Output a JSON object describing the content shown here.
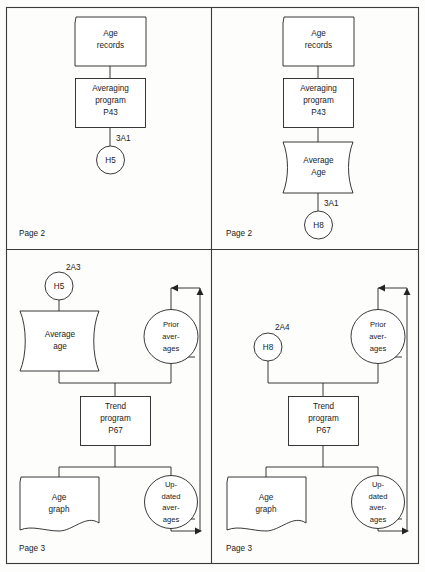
{
  "diagram": {
    "colors": {
      "stroke": "#232323",
      "frame": "#3a3a3a",
      "background": "#fdfdfc",
      "shape_fill": "#ffffff"
    },
    "panels": [
      {
        "id": "panel-top-left",
        "page_label": "Page 2",
        "nodes": [
          {
            "id": "tl-age-records",
            "shape": "punched-card",
            "lines": [
              "Age",
              "records"
            ]
          },
          {
            "id": "tl-averaging-program",
            "shape": "process",
            "lines": [
              "Averaging",
              "program",
              "P43"
            ]
          },
          {
            "id": "tl-h5",
            "shape": "connector-circle",
            "lines": [
              "H5"
            ]
          }
        ],
        "connector_refs": [
          {
            "id": "tl-ref-3a1",
            "text": "3A1"
          }
        ]
      },
      {
        "id": "panel-top-right",
        "page_label": "Page 2",
        "nodes": [
          {
            "id": "tr-age-records",
            "shape": "punched-card",
            "lines": [
              "Age",
              "records"
            ]
          },
          {
            "id": "tr-averaging-program",
            "shape": "process",
            "lines": [
              "Averaging",
              "program",
              "P43"
            ]
          },
          {
            "id": "tr-average-age",
            "shape": "magnetic-tape",
            "lines": [
              "Average",
              "Age"
            ]
          },
          {
            "id": "tr-h8",
            "shape": "connector-circle",
            "lines": [
              "H8"
            ]
          }
        ],
        "connector_refs": [
          {
            "id": "tr-ref-3a1",
            "text": "3A1"
          }
        ]
      },
      {
        "id": "panel-bottom-left",
        "page_label": "Page 3",
        "nodes": [
          {
            "id": "bl-h5",
            "shape": "connector-circle",
            "lines": [
              "H5"
            ]
          },
          {
            "id": "bl-average-age",
            "shape": "magnetic-tape",
            "lines": [
              "Average",
              "age"
            ]
          },
          {
            "id": "bl-prior-averages",
            "shape": "magnetic-drum",
            "lines": [
              "Prior",
              "aver-",
              "ages"
            ]
          },
          {
            "id": "bl-trend-program",
            "shape": "process",
            "lines": [
              "Trend",
              "program",
              "P67"
            ]
          },
          {
            "id": "bl-age-graph",
            "shape": "document",
            "lines": [
              "Age",
              "graph"
            ]
          },
          {
            "id": "bl-updated-averages",
            "shape": "magnetic-drum",
            "lines": [
              "Up-",
              "dated",
              "aver-",
              "ages"
            ]
          }
        ],
        "connector_refs": [
          {
            "id": "bl-ref-2a3",
            "text": "2A3"
          }
        ]
      },
      {
        "id": "panel-bottom-right",
        "page_label": "Page 3",
        "nodes": [
          {
            "id": "br-h8",
            "shape": "connector-circle",
            "lines": [
              "H8"
            ]
          },
          {
            "id": "br-prior-averages",
            "shape": "magnetic-drum",
            "lines": [
              "Prior",
              "aver-",
              "ages"
            ]
          },
          {
            "id": "br-trend-program",
            "shape": "process",
            "lines": [
              "Trend",
              "program",
              "P67"
            ]
          },
          {
            "id": "br-age-graph",
            "shape": "document",
            "lines": [
              "Age",
              "graph"
            ]
          },
          {
            "id": "br-updated-averages",
            "shape": "magnetic-drum",
            "lines": [
              "Up-",
              "dated",
              "aver-",
              "ages"
            ]
          }
        ],
        "connector_refs": [
          {
            "id": "br-ref-2a4",
            "text": "2A4"
          }
        ]
      }
    ],
    "text": {
      "tl": {
        "age_records_1": "Age",
        "age_records_2": "records",
        "avg_prog_1": "Averaging",
        "avg_prog_2": "program",
        "avg_prog_3": "P43",
        "h5": "H5",
        "ref_3a1": "3A1",
        "page": "Page 2"
      },
      "tr": {
        "age_records_1": "Age",
        "age_records_2": "records",
        "avg_prog_1": "Averaging",
        "avg_prog_2": "program",
        "avg_prog_3": "P43",
        "avg_age_1": "Average",
        "avg_age_2": "Age",
        "h8": "H8",
        "ref_3a1": "3A1",
        "page": "Page 2"
      },
      "bl": {
        "h5": "H5",
        "ref_2a3": "2A3",
        "avg_age_1": "Average",
        "avg_age_2": "age",
        "prior_1": "Prior",
        "prior_2": "aver-",
        "prior_3": "ages",
        "trend_1": "Trend",
        "trend_2": "program",
        "trend_3": "P67",
        "graph_1": "Age",
        "graph_2": "graph",
        "updated_1": "Up-",
        "updated_2": "dated",
        "updated_3": "aver-",
        "updated_4": "ages",
        "page": "Page 3"
      },
      "br": {
        "h8": "H8",
        "ref_2a4": "2A4",
        "prior_1": "Prior",
        "prior_2": "aver-",
        "prior_3": "ages",
        "trend_1": "Trend",
        "trend_2": "program",
        "trend_3": "P67",
        "graph_1": "Age",
        "graph_2": "graph",
        "updated_1": "Up-",
        "updated_2": "dated",
        "updated_3": "aver-",
        "updated_4": "ages",
        "page": "Page 3"
      }
    }
  }
}
